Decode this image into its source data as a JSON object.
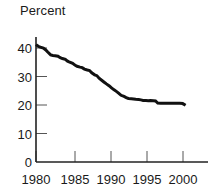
{
  "chart_data": {
    "type": "line",
    "title": "Percent",
    "xlabel": "",
    "ylabel": "",
    "ylim": [
      0,
      44
    ],
    "xlim": [
      1980,
      2001
    ],
    "grid": false,
    "legend": null,
    "yticks": [
      0,
      10,
      20,
      30,
      40
    ],
    "ytick_labels": [
      "0",
      "10",
      "20",
      "30",
      "40"
    ],
    "xticks": [
      1980,
      1985,
      1990,
      1995,
      2000
    ],
    "xtick_labels": [
      "1980",
      "1985",
      "1990",
      "1995",
      "2000"
    ],
    "line_color": "#111111",
    "line_width": 3,
    "series": [
      {
        "name": "Percent",
        "x": [
          1980.0,
          1980.3,
          1980.6,
          1981.0,
          1981.3,
          1981.6,
          1982.0,
          1982.3,
          1982.6,
          1983.0,
          1983.3,
          1983.6,
          1984.0,
          1984.3,
          1984.6,
          1985.0,
          1985.3,
          1985.6,
          1986.0,
          1986.3,
          1986.6,
          1987.0,
          1987.3,
          1987.6,
          1988.0,
          1988.3,
          1988.6,
          1989.0,
          1989.3,
          1989.6,
          1990.0,
          1990.3,
          1990.6,
          1991.0,
          1991.3,
          1991.6,
          1992.0,
          1992.3,
          1992.6,
          1993.0,
          1993.3,
          1993.6,
          1994.0,
          1994.3,
          1994.6,
          1995.0,
          1995.3,
          1995.6,
          1996.0,
          1996.3,
          1996.6,
          1997.0,
          1997.3,
          1997.6,
          1998.0,
          1998.3,
          1998.6,
          1999.0,
          1999.3,
          1999.6,
          2000.0,
          2000.4
        ],
        "y": [
          41.2,
          40.6,
          40.3,
          40.0,
          39.4,
          38.6,
          37.6,
          37.4,
          37.3,
          37.1,
          36.6,
          36.3,
          36.0,
          35.4,
          35.0,
          34.6,
          34.0,
          33.6,
          33.3,
          33.1,
          32.6,
          32.3,
          32.1,
          31.3,
          30.6,
          30.3,
          29.4,
          28.6,
          28.0,
          27.4,
          26.7,
          26.0,
          25.4,
          24.7,
          24.1,
          23.4,
          23.0,
          22.6,
          22.3,
          22.2,
          22.1,
          22.0,
          21.9,
          21.8,
          21.6,
          21.6,
          21.5,
          21.6,
          21.5,
          21.4,
          20.7,
          20.6,
          20.6,
          20.6,
          20.6,
          20.6,
          20.6,
          20.6,
          20.6,
          20.6,
          20.5,
          19.9
        ]
      }
    ]
  },
  "axes": {
    "axis_color": "#222222",
    "tick_color": "#555555"
  }
}
